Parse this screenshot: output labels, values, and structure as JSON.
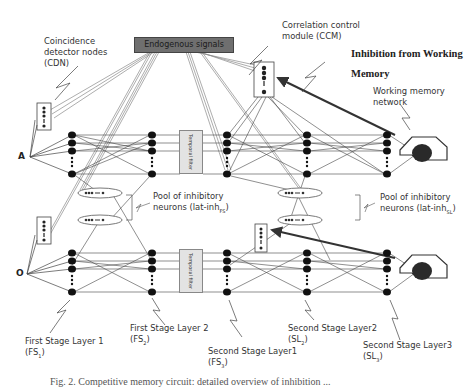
{
  "diagram": {
    "title_box": "Endogenous signals",
    "inputs": {
      "top": "A",
      "bottom": "O"
    },
    "temporal_filter_label": "Temporal filter",
    "labels": {
      "cdn": [
        "Coincidence",
        "detector nodes",
        "(CDN)"
      ],
      "ccm": [
        "Correlation control",
        "module (CCM)"
      ],
      "inhibition_wm": [
        "Inhibition from Working",
        "Memory"
      ],
      "wm_network": [
        "Working memory",
        "network"
      ],
      "pool_fs": [
        "Pool of inhibitory",
        "neurons (lat-inh",
        "FS",
        ")"
      ],
      "pool_sl": [
        "Pool of inhibitory",
        "neurons (lat-inh",
        "SL",
        ")"
      ],
      "fs1": [
        "First Stage Layer 1",
        "(FS",
        "1",
        ")"
      ],
      "fs2": [
        "First Stage Layer 2",
        "(FS",
        "2",
        ")"
      ],
      "sl1": [
        "Second Stage Layer1",
        "(FS",
        "3",
        ")"
      ],
      "sl2": [
        "Second Stage Layer2",
        "(SL",
        "2",
        ")"
      ],
      "sl3": [
        "Second Stage Layer3",
        "(SL",
        "3",
        ")"
      ]
    },
    "caption": "Fig. 2.  Competitive memory circuit: detailed overview of inhibition ...",
    "colors": {
      "node": "#1a1a1a",
      "line": "#555555",
      "endo_box": "#6f6f6f",
      "filter_box": "#e3e3e3"
    }
  }
}
